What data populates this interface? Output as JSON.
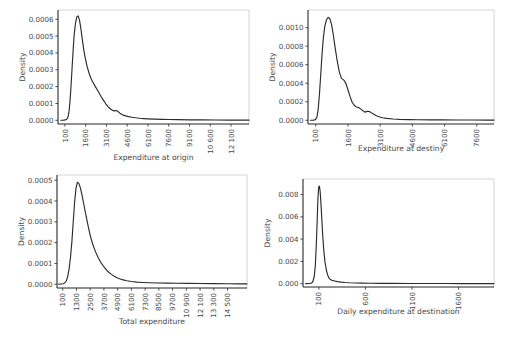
{
  "figure": {
    "background": "#ffffff",
    "curve_color": "#2b2b2b",
    "text_color": "#4a4a4a",
    "frame_color": "#c9c9c9",
    "panel_count": 4,
    "layout": "2x2 grid of kernel density plots"
  },
  "chart_data": [
    {
      "id": "expenditure-at-origin",
      "type": "line",
      "title": "",
      "xlabel": "Expenditure at origin",
      "ylabel": "Density",
      "grid": false,
      "legend": null,
      "xticks": [
        100,
        1600,
        3100,
        4600,
        6100,
        7600,
        9100,
        10600,
        12100
      ],
      "xtick_labels": [
        "100",
        "1600",
        "3100",
        "4600",
        "6100",
        "7600",
        "9100",
        "10 600",
        "12 100"
      ],
      "yticks": [
        0.0,
        0.0001,
        0.0002,
        0.0003,
        0.0004,
        0.0005,
        0.0006
      ],
      "ytick_labels": [
        "0.0000",
        "0.0001",
        "0.0002",
        "0.0003",
        "0.0004",
        "0.0005",
        "0.0006"
      ],
      "xlim": [
        -400,
        13400
      ],
      "ylim": [
        -2.2e-05,
        0.000655
      ],
      "x": [
        -200,
        0,
        120,
        200,
        280,
        340,
        400,
        460,
        520,
        600,
        680,
        760,
        860,
        960,
        1060,
        1160,
        1260,
        1360,
        1460,
        1560,
        1700,
        1850,
        2000,
        2150,
        2300,
        2500,
        2700,
        2900,
        3050,
        3200,
        3350,
        3500,
        3650,
        3800,
        3950,
        4100,
        4300,
        4500,
        4700,
        4950,
        5200,
        5500,
        5800,
        6100,
        6600,
        7100,
        7600,
        8300,
        9100,
        10000,
        11000,
        12000,
        13000,
        13400
      ],
      "y": [
        5e-07,
        1e-06,
        2.2e-06,
        4.5e-06,
        1.1e-05,
        2.5e-05,
        5.5e-05,
        0.000105,
        0.000175,
        0.000285,
        0.0004,
        0.0005,
        0.000575,
        0.000614,
        0.00062,
        0.000592,
        0.00054,
        0.000478,
        0.00042,
        0.000373,
        0.00032,
        0.000278,
        0.000245,
        0.000222,
        0.0002,
        0.000172,
        0.000143,
        0.000117,
        9.8e-05,
        8.3e-05,
        7e-05,
        6.1e-05,
        5.6e-05,
        5.8e-05,
        5.2e-05,
        4e-05,
        3.1e-05,
        2.6e-05,
        2.2e-05,
        1.8e-05,
        1.5e-05,
        1.2e-05,
        1e-05,
        8.5e-06,
        6.6e-06,
        5.4e-06,
        4.5e-06,
        3.6e-06,
        2.8e-06,
        2.1e-06,
        1.6e-06,
        1.3e-06,
        1.1e-06,
        1e-06
      ]
    },
    {
      "id": "expenditure-at-destiny",
      "type": "line",
      "title": "",
      "xlabel": "Expenditure at destiny",
      "ylabel": "Density",
      "grid": false,
      "legend": null,
      "xticks": [
        100,
        1600,
        3100,
        4600,
        6100,
        7600
      ],
      "xtick_labels": [
        "100",
        "1600",
        "3100",
        "4600",
        "6100",
        "7600"
      ],
      "yticks": [
        0.0,
        0.0002,
        0.0004,
        0.0006,
        0.0008,
        0.001
      ],
      "ytick_labels": [
        "0.0000",
        "0.0002",
        "0.0004",
        "0.0006",
        "0.0008",
        "0.0010"
      ],
      "xlim": [
        -260,
        8400
      ],
      "ylim": [
        -4e-05,
        0.00119
      ],
      "x": [
        -150,
        0,
        80,
        150,
        210,
        270,
        330,
        390,
        450,
        520,
        600,
        680,
        760,
        840,
        920,
        1000,
        1100,
        1200,
        1300,
        1400,
        1500,
        1600,
        1700,
        1800,
        1900,
        2000,
        2100,
        2200,
        2300,
        2400,
        2500,
        2600,
        2750,
        2900,
        3050,
        3200,
        3400,
        3700,
        4000,
        4400,
        4900,
        5400,
        6000,
        6700,
        7400,
        8100,
        8400
      ],
      "y": [
        1e-06,
        2e-06,
        7e-06,
        3e-05,
        0.00011,
        0.00027,
        0.00048,
        0.0007,
        0.00088,
        0.00101,
        0.001085,
        0.00111,
        0.001095,
        0.00103,
        0.00092,
        0.00079,
        0.00064,
        0.00052,
        0.000452,
        0.000436,
        0.0004,
        0.00033,
        0.000255,
        0.000192,
        0.00016,
        0.000144,
        0.000138,
        0.00012,
        0.000102,
        8.8e-05,
        9.8e-05,
        9.4e-05,
        7.2e-05,
        5.2e-05,
        3.8e-05,
        2.8e-05,
        2e-05,
        1.4e-05,
        1e-05,
        7.5e-06,
        5.8e-06,
        4.7e-06,
        3.9e-06,
        3.2e-06,
        2.7e-06,
        2.3e-06,
        2e-06
      ]
    },
    {
      "id": "total-expenditure",
      "type": "line",
      "title": "",
      "xlabel": "Total expenditure",
      "ylabel": "Density",
      "grid": false,
      "legend": null,
      "xticks": [
        100,
        1300,
        2500,
        3700,
        4900,
        6100,
        7300,
        8500,
        9700,
        10900,
        12100,
        13300,
        14500
      ],
      "xtick_labels": [
        "100",
        "1300",
        "2500",
        "3700",
        "4900",
        "6100",
        "7300",
        "8500",
        "9700",
        "10 900",
        "12 100",
        "13 300",
        "14 500"
      ],
      "yticks": [
        0.0,
        0.0001,
        0.0002,
        0.0003,
        0.0004,
        0.0005
      ],
      "ytick_labels": [
        "0.0000",
        "0.0001",
        "0.0002",
        "0.0003",
        "0.0004",
        "0.0005"
      ],
      "xlim": [
        -400,
        16200
      ],
      "ylim": [
        -1.8e-05,
        0.000525
      ],
      "x": [
        -250,
        0,
        150,
        300,
        420,
        540,
        660,
        780,
        900,
        1020,
        1140,
        1260,
        1380,
        1500,
        1650,
        1800,
        1950,
        2100,
        2300,
        2500,
        2700,
        2950,
        3200,
        3450,
        3700,
        4000,
        4300,
        4600,
        4900,
        5300,
        5700,
        6100,
        6600,
        7100,
        7700,
        8400,
        9200,
        10100,
        11100,
        12200,
        13300,
        14500,
        15500,
        16200
      ],
      "y": [
        5e-07,
        1e-06,
        2.5e-06,
        7e-06,
        1.7e-05,
        3.8e-05,
        7.5e-05,
        0.00013,
        0.000205,
        0.0003,
        0.000395,
        0.000462,
        0.00049,
        0.000486,
        0.000462,
        0.000425,
        0.000382,
        0.00034,
        0.000285,
        0.000235,
        0.000196,
        0.000158,
        0.000127,
        0.000103,
        8.4e-05,
        6.4e-05,
        5e-05,
        3.8e-05,
        3e-05,
        2.2e-05,
        1.7e-05,
        1.3e-05,
        1e-05,
        8.5e-06,
        7.2e-06,
        6.2e-06,
        5.4e-06,
        4.7e-06,
        4e-06,
        3.4e-06,
        2.9e-06,
        2.5e-06,
        2.1e-06,
        2e-06
      ]
    },
    {
      "id": "daily-expenditure-at-destination",
      "type": "line",
      "title": "",
      "xlabel": "Daily expenditure at destination",
      "ylabel": "Density",
      "grid": false,
      "legend": null,
      "xticks": [
        100,
        600,
        1100,
        1600
      ],
      "xtick_labels": [
        "100",
        "600",
        "1100",
        "1600"
      ],
      "yticks": [
        0.0,
        0.002,
        0.004,
        0.006,
        0.008
      ],
      "ytick_labels": [
        "0.000",
        "0.002",
        "0.004",
        "0.006",
        "0.008"
      ],
      "xlim": [
        -70,
        1980
      ],
      "ylim": [
        -0.0003,
        0.0094
      ],
      "x": [
        -40,
        0,
        20,
        35,
        50,
        62,
        72,
        82,
        90,
        98,
        106,
        114,
        122,
        132,
        142,
        152,
        165,
        180,
        195,
        215,
        240,
        270,
        300,
        340,
        380,
        430,
        490,
        560,
        650,
        760,
        900,
        1060,
        1250,
        1450,
        1650,
        1850,
        1980
      ],
      "y": [
        4e-06,
        1e-05,
        4e-05,
        0.00017,
        0.0006,
        0.0016,
        0.0033,
        0.0056,
        0.0076,
        0.00868,
        0.00876,
        0.0083,
        0.0073,
        0.0058,
        0.0043,
        0.0031,
        0.002,
        0.00125,
        0.00076,
        0.00043,
        0.0003,
        0.00024,
        0.00018,
        0.000135,
        0.000104,
        7.8e-05,
        5.8e-05,
        4.4e-05,
        3.4e-05,
        2.7e-05,
        2.1e-05,
        1.7e-05,
        1.3e-05,
        1.1e-05,
        9e-06,
        8e-06,
        7e-06
      ]
    }
  ]
}
